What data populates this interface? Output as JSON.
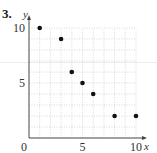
{
  "problem": {
    "number": "3."
  },
  "chart_data": {
    "type": "scatter",
    "title": "",
    "xlabel": "x",
    "ylabel": "y",
    "xlim": [
      0,
      10
    ],
    "ylim": [
      0,
      10
    ],
    "grid": true,
    "x_ticks": [
      "0",
      "5",
      "10"
    ],
    "y_ticks": [
      "5",
      "10"
    ],
    "points": [
      {
        "x": 1,
        "y": 10
      },
      {
        "x": 3,
        "y": 9
      },
      {
        "x": 4,
        "y": 6
      },
      {
        "x": 5,
        "y": 5
      },
      {
        "x": 6,
        "y": 4
      },
      {
        "x": 8,
        "y": 2
      },
      {
        "x": 10,
        "y": 2
      }
    ],
    "legend": null
  }
}
